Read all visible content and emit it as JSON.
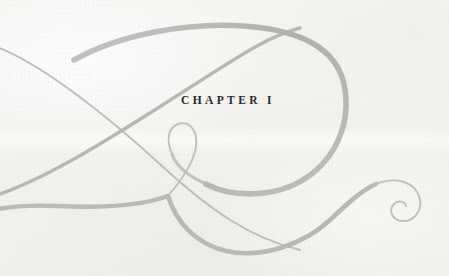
{
  "page": {
    "kind": "book-chapter-opening",
    "width": 449,
    "height": 276,
    "paper_color": "#f4f3f0",
    "paper_highlight": "#f7f6f3",
    "paper_shadow": "#f0efeb"
  },
  "heading": {
    "full_text": "CHAPTER I",
    "word": "CHAPTER",
    "numeral": "I",
    "color": "#2b2b2d",
    "align": "center"
  },
  "ornament": {
    "name": "calligraphic-flourish",
    "description": "Large swash loop resembling a cursive figure with a crossing diagonal stroke, a small teardrop eyelet at center, and a spiral curl terminal at lower right.",
    "stroke_color": "#b2b2b2",
    "stroke_color_light": "#c8c8c6",
    "stroke_color_dark": "#a6a6a6",
    "strokes": [
      {
        "name": "main-loop",
        "weight": "thick-tapered"
      },
      {
        "name": "crossing-diagonal",
        "weight": "medium-tapered"
      },
      {
        "name": "teardrop-eyelet",
        "weight": "thin"
      },
      {
        "name": "bottom-sweep",
        "weight": "thick-tapered"
      },
      {
        "name": "spiral-curl-terminal",
        "weight": "thin"
      },
      {
        "name": "upper-left-hairline",
        "weight": "thin"
      }
    ]
  }
}
